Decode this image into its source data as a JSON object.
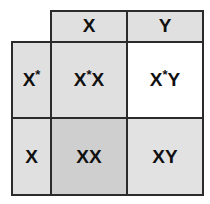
{
  "diagram": {
    "type": "punnett-square",
    "header": {
      "columns": [
        {
          "allele": "X",
          "fill": "#e0e0e0"
        },
        {
          "allele": "Y",
          "fill": "#e0e0e0"
        }
      ]
    },
    "rows": [
      {
        "allele": "X",
        "allele_mark": "*",
        "fill": "#e0e0e0",
        "cells": [
          {
            "genotype_a": "X",
            "mark": "*",
            "genotype_b": "X",
            "fill": "#e0e0e0"
          },
          {
            "genotype_a": "X",
            "mark": "*",
            "genotype_b": "Y",
            "fill": "#ffffff"
          }
        ]
      },
      {
        "allele": "X",
        "allele_mark": "",
        "fill": "#e0e0e0",
        "cells": [
          {
            "genotype_a": "X",
            "mark": "",
            "genotype_b": "X",
            "fill": "#cfcfcf"
          },
          {
            "genotype_a": "X",
            "mark": "",
            "genotype_b": "Y",
            "fill": "#e2e2e2"
          }
        ]
      }
    ],
    "colors": {
      "border": "#2b2b2b",
      "text": "#111111"
    }
  }
}
